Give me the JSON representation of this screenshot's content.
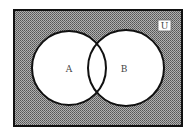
{
  "diagram": {
    "type": "venn",
    "universe_label": "U",
    "sets": [
      {
        "label": "A"
      },
      {
        "label": "B"
      }
    ],
    "shaded_region": "complement of A union B",
    "colors": {
      "shading": "#8a8a8a",
      "outline": "#111111",
      "circle_fill": "#ffffff",
      "background": "#ffffff"
    }
  }
}
